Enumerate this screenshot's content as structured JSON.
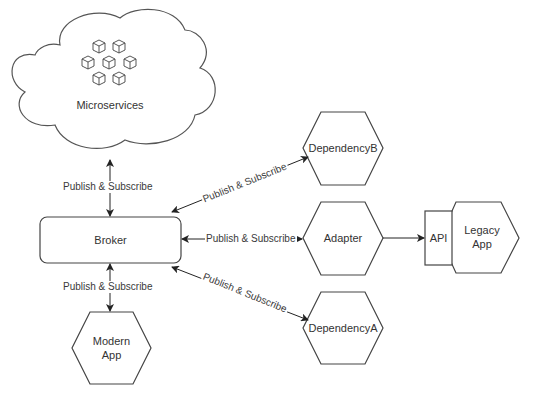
{
  "diagram": {
    "nodes": {
      "microservices": {
        "label": "Microservices",
        "shape": "cloud",
        "icon": "cubes-cluster-icon"
      },
      "broker": {
        "label": "Broker",
        "shape": "rounded-rectangle"
      },
      "modern_app": {
        "line1": "Modern",
        "line2": "App",
        "shape": "hexagon"
      },
      "dependency_b": {
        "label": "DependencyB",
        "shape": "hexagon"
      },
      "adapter": {
        "label": "Adapter",
        "shape": "hexagon"
      },
      "dependency_a": {
        "label": "DependencyA",
        "shape": "hexagon"
      },
      "api": {
        "label": "API",
        "shape": "rectangle"
      },
      "legacy_app": {
        "line1": "Legacy",
        "line2": "App",
        "shape": "hexagon"
      }
    },
    "edges": [
      {
        "from": "broker",
        "to": "microservices",
        "label": "Publish & Subscribe",
        "direction": "bidirectional"
      },
      {
        "from": "broker",
        "to": "modern_app",
        "label": "Publish & Subscribe",
        "direction": "bidirectional"
      },
      {
        "from": "broker",
        "to": "dependency_b",
        "label": "Publish & Subscribe",
        "direction": "bidirectional"
      },
      {
        "from": "broker",
        "to": "adapter",
        "label": "Publish & Subscribe",
        "direction": "bidirectional"
      },
      {
        "from": "broker",
        "to": "dependency_a",
        "label": "Publish & Subscribe",
        "direction": "bidirectional"
      },
      {
        "from": "adapter",
        "to": "api",
        "label": "",
        "direction": "forward"
      }
    ],
    "colors": {
      "stroke": "#333333",
      "text": "#333333",
      "background": "#ffffff"
    }
  }
}
